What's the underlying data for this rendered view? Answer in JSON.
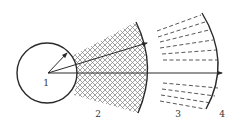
{
  "diagram": {
    "colors": {
      "stroke": "#2a2a2a",
      "hatch": "#7a7a7a",
      "dash": "#444444",
      "label": "#333333"
    },
    "labels": [
      {
        "id": "1",
        "text": "1",
        "x": 46,
        "y": 86
      },
      {
        "id": "2",
        "text": "2",
        "x": 98,
        "y": 117
      },
      {
        "id": "3",
        "text": "3",
        "x": 178,
        "y": 117
      },
      {
        "id": "4",
        "text": "4",
        "x": 222,
        "y": 117
      }
    ],
    "circle": {
      "cx": 47,
      "cy": 73,
      "r": 30
    },
    "hatched_region": {
      "pattern": "diagonal-crosshatch",
      "spacing": 4
    },
    "dashed_lines_upper_count": 6,
    "dashed_lines_lower_count": 4
  }
}
